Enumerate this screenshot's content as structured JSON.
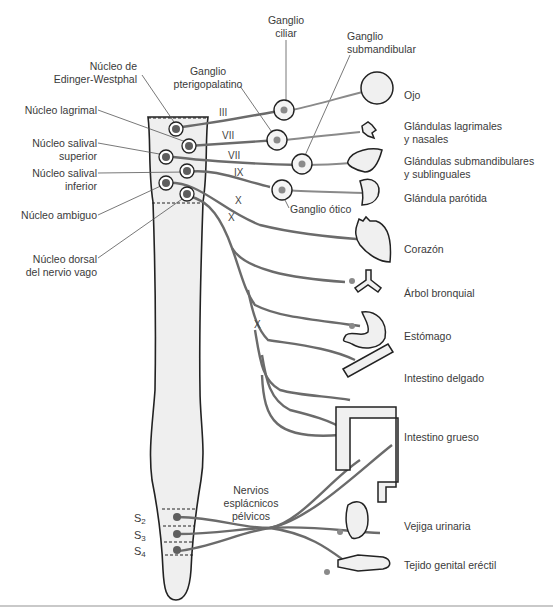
{
  "diagram": {
    "title": "",
    "colors": {
      "nerve": "#6b6b6b",
      "nucleus_fill": "#5e5e5e",
      "cord_fill": "#efefef",
      "outline": "#222222",
      "ganglion_fill": "#f4f4f4",
      "ganglion_dot": "#8a8a8a"
    },
    "nuclei_labels": {
      "edinger": [
        "Núcleo de",
        "Edinger-Westphal"
      ],
      "lagrimal": "Núcleo lagrimal",
      "salival_sup": [
        "Núcleo salival",
        "superior"
      ],
      "salival_inf": [
        "Núcleo salival",
        "inferior"
      ],
      "ambiguo": "Núcleo ambiguo",
      "dorsal_vago": [
        "Núcleo dorsal",
        "del nervio vago"
      ]
    },
    "ganglia_labels": {
      "ciliar": [
        "Ganglio",
        "ciliar"
      ],
      "pterigopalatino": [
        "Ganglio",
        "pterigopalatino"
      ],
      "submandibular": [
        "Ganglio",
        "submandibular"
      ],
      "otico": "Ganglio ótico"
    },
    "cranial_nerves": [
      "III",
      "VII",
      "VII",
      "IX",
      "X",
      "X",
      "X"
    ],
    "sacral_segments": [
      {
        "letter": "S",
        "num": "2"
      },
      {
        "letter": "S",
        "num": "3"
      },
      {
        "letter": "S",
        "num": "4"
      }
    ],
    "pelvic_label": [
      "Nervios",
      "esplácnicos",
      "pélvicos"
    ],
    "targets": [
      {
        "name": "ojo",
        "label": [
          "Ojo"
        ]
      },
      {
        "name": "lagrimales",
        "label": [
          "Glándulas lagrimales",
          "y nasales"
        ]
      },
      {
        "name": "submandibulares",
        "label": [
          "Glándulas submandibulares",
          "y sublinguales"
        ]
      },
      {
        "name": "parotida",
        "label": [
          "Glándula parótida"
        ]
      },
      {
        "name": "corazon",
        "label": [
          "Corazón"
        ]
      },
      {
        "name": "bronquial",
        "label": [
          "Árbol bronquial"
        ]
      },
      {
        "name": "estomago",
        "label": [
          "Estómago"
        ]
      },
      {
        "name": "intestino-delgado",
        "label": [
          "Intestino delgado"
        ]
      },
      {
        "name": "intestino-grueso",
        "label": [
          "Intestino grueso"
        ]
      },
      {
        "name": "vejiga",
        "label": [
          "Vejiga urinaria"
        ]
      },
      {
        "name": "genital",
        "label": [
          "Tejido genital eréctil"
        ]
      }
    ]
  }
}
